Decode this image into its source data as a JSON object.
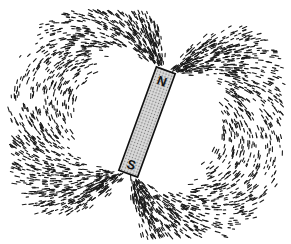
{
  "figure": {
    "background": "#ffffff",
    "filing_color": "#1a1a1a"
  },
  "magnet": {
    "north_label": "N",
    "south_label": "S",
    "center": [
      147,
      122
    ],
    "length": 110,
    "width": 20,
    "rotation_deg": 20,
    "fill": "#c8c8c8",
    "stroke": "#111111"
  },
  "field": {
    "filing_count": 2600,
    "seed": 7
  }
}
